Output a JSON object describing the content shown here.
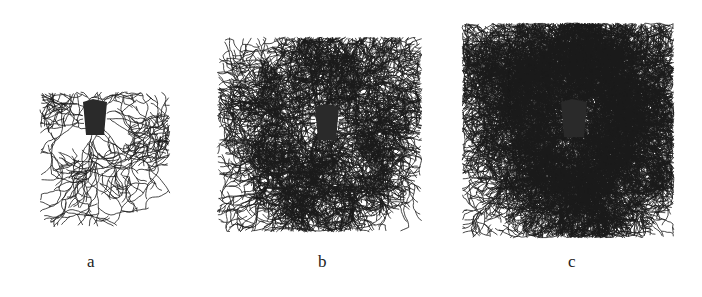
{
  "figure": {
    "panels": [
      {
        "id": "a",
        "label": "a",
        "density": "sparse",
        "center": [
          95,
          117
        ],
        "block": {
          "w": 24,
          "h": 36
        },
        "spread": {
          "left": 55,
          "right": 75,
          "up": 25,
          "down": 110
        },
        "branches": 14,
        "depth": 5,
        "seed": 11
      },
      {
        "id": "b",
        "label": "b",
        "density": "medium",
        "center": [
          327,
          122
        ],
        "block": {
          "w": 24,
          "h": 36
        },
        "spread": {
          "left": 110,
          "right": 95,
          "up": 85,
          "down": 110
        },
        "branches": 60,
        "depth": 6,
        "seed": 23
      },
      {
        "id": "c",
        "label": "c",
        "density": "dense",
        "center": [
          574,
          118
        ],
        "block": {
          "w": 26,
          "h": 38
        },
        "spread": {
          "left": 112,
          "right": 100,
          "up": 95,
          "down": 120
        },
        "branches": 140,
        "depth": 6,
        "seed": 37
      }
    ],
    "colors": {
      "branch": "#1a1a1a",
      "block": "#2a2a2a",
      "background": "#ffffff"
    }
  },
  "labels": {
    "a": "a",
    "b": "b",
    "c": "c"
  }
}
